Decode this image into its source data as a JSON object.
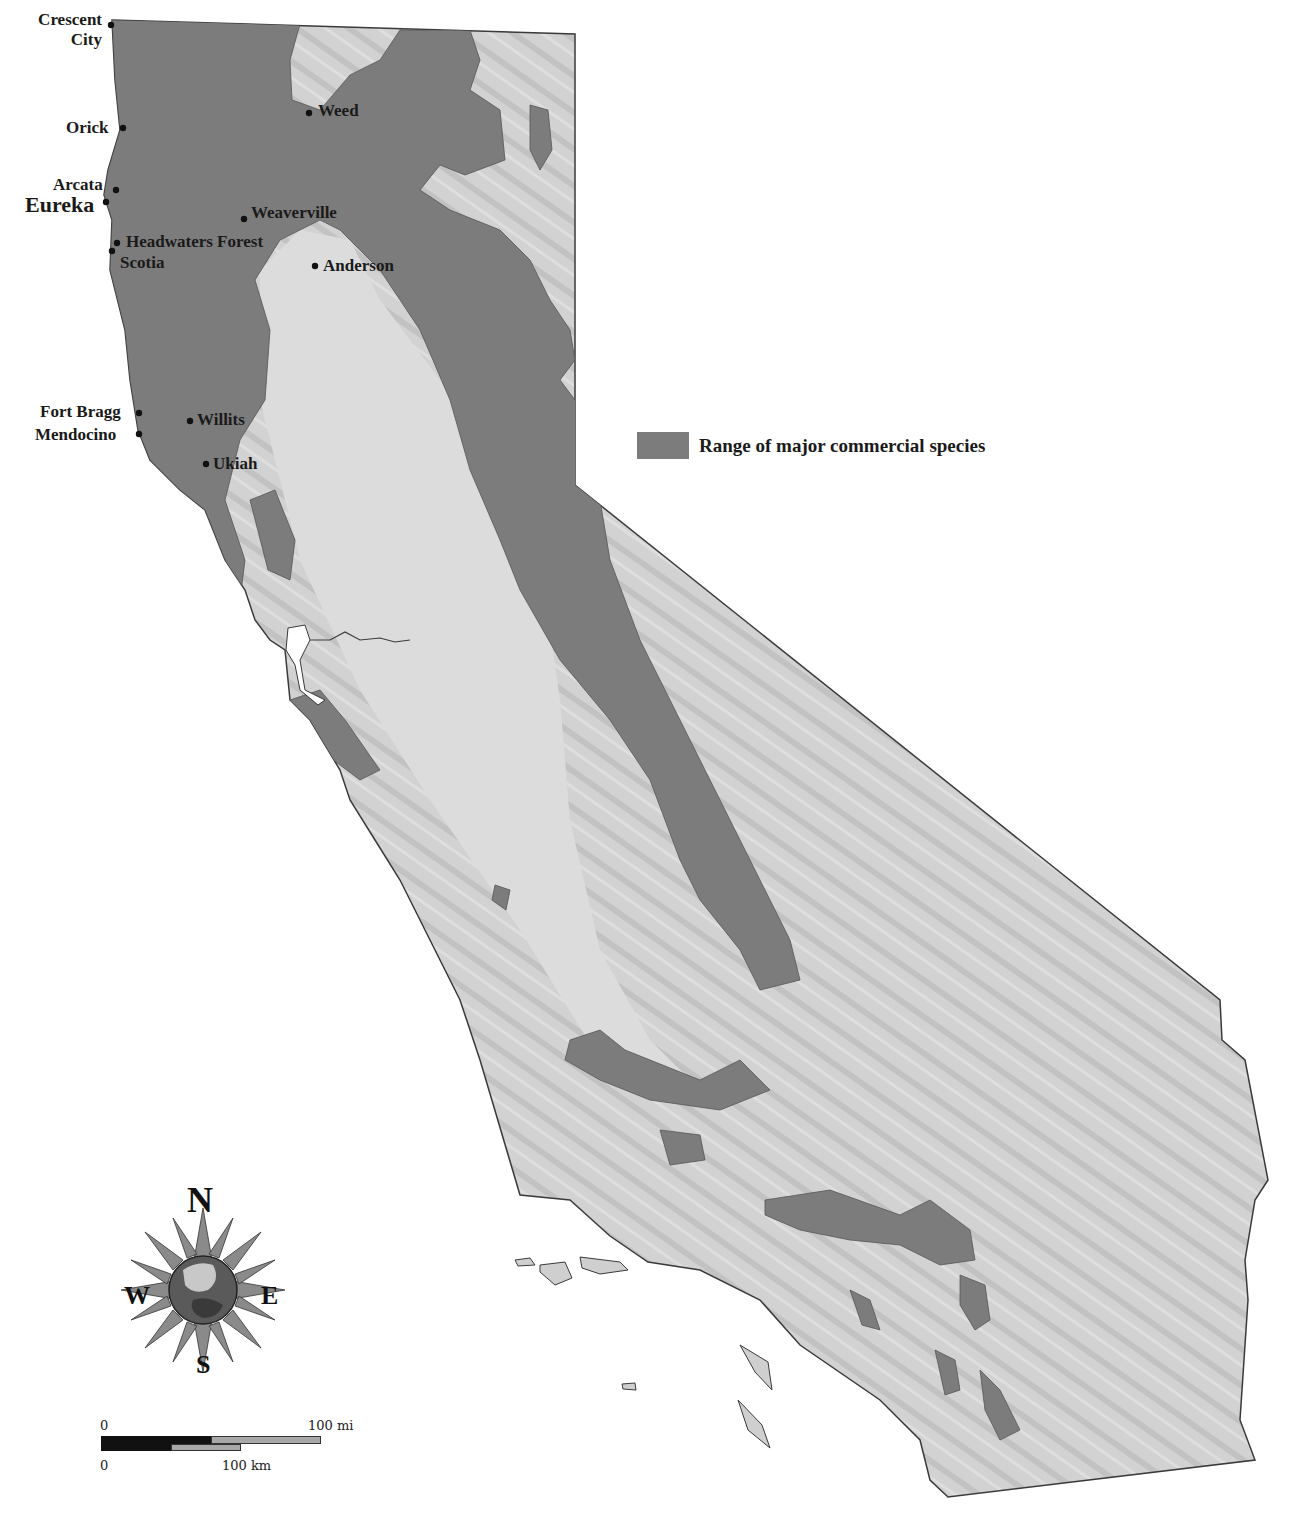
{
  "map": {
    "legend": {
      "label": "Range of major commercial species",
      "swatch_color": "#7c7c7c"
    },
    "colors": {
      "range": "#7c7c7c",
      "land": "#cfcfcf",
      "outline": "#3a3a3a",
      "water": "#ffffff"
    },
    "cities": [
      {
        "name_line1": "Crescent",
        "name_line2": "City"
      },
      {
        "name": "Orick"
      },
      {
        "name": "Arcata"
      },
      {
        "name": "Eureka"
      },
      {
        "name": "Headwaters Forest"
      },
      {
        "name": "Scotia"
      },
      {
        "name": "Weed"
      },
      {
        "name": "Weaverville"
      },
      {
        "name": "Anderson"
      },
      {
        "name": "Fort Bragg"
      },
      {
        "name": "Mendocino"
      },
      {
        "name": "Willits"
      },
      {
        "name": "Ukiah"
      }
    ],
    "compass": {
      "n": "N",
      "s": "S",
      "e": "E",
      "w": "W"
    },
    "scale": {
      "mi_start": "0",
      "mi_end": "100 mi",
      "km_start": "0",
      "km_end": "100 km"
    }
  }
}
